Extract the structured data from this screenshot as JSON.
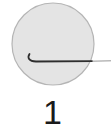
{
  "figure": {
    "label": "1",
    "circle_fill": "#e4e4e4",
    "circle_stroke": "#b5b5b5",
    "stroke_color": "#333333"
  }
}
